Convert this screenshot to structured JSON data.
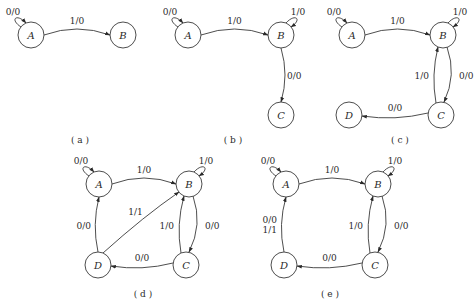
{
  "diagrams": [
    {
      "caption": "( a )",
      "states": [
        "A",
        "B"
      ],
      "transitions": [
        {
          "from": "A",
          "to": "A",
          "label": "0/0"
        },
        {
          "from": "A",
          "to": "B",
          "label": "1/0"
        }
      ]
    },
    {
      "caption": "( b )",
      "states": [
        "A",
        "B",
        "C"
      ],
      "transitions": [
        {
          "from": "A",
          "to": "A",
          "label": "0/0"
        },
        {
          "from": "A",
          "to": "B",
          "label": "1/0"
        },
        {
          "from": "B",
          "to": "B",
          "label": "1/0"
        },
        {
          "from": "B",
          "to": "C",
          "label": "0/0"
        }
      ]
    },
    {
      "caption": "( c )",
      "states": [
        "A",
        "B",
        "C",
        "D"
      ],
      "transitions": [
        {
          "from": "A",
          "to": "A",
          "label": "0/0"
        },
        {
          "from": "A",
          "to": "B",
          "label": "1/0"
        },
        {
          "from": "B",
          "to": "B",
          "label": "1/0"
        },
        {
          "from": "B",
          "to": "C",
          "label": "0/0"
        },
        {
          "from": "C",
          "to": "B",
          "label": "1/0"
        },
        {
          "from": "C",
          "to": "D",
          "label": "0/0"
        }
      ]
    },
    {
      "caption": "( d )",
      "states": [
        "A",
        "B",
        "C",
        "D"
      ],
      "transitions": [
        {
          "from": "A",
          "to": "A",
          "label": "0/0"
        },
        {
          "from": "A",
          "to": "B",
          "label": "1/0"
        },
        {
          "from": "B",
          "to": "B",
          "label": "1/0"
        },
        {
          "from": "B",
          "to": "C",
          "label": "0/0"
        },
        {
          "from": "C",
          "to": "B",
          "label": "1/0"
        },
        {
          "from": "C",
          "to": "D",
          "label": "0/0"
        },
        {
          "from": "D",
          "to": "A",
          "label": "0/0"
        },
        {
          "from": "D",
          "to": "B",
          "label": "1/1"
        }
      ]
    },
    {
      "caption": "( e )",
      "states": [
        "A",
        "B",
        "C",
        "D"
      ],
      "transitions": [
        {
          "from": "A",
          "to": "A",
          "label": "0/0"
        },
        {
          "from": "A",
          "to": "B",
          "label": "1/0"
        },
        {
          "from": "B",
          "to": "B",
          "label": "1/0"
        },
        {
          "from": "B",
          "to": "C",
          "label": "0/0"
        },
        {
          "from": "C",
          "to": "B",
          "label": "1/0"
        },
        {
          "from": "C",
          "to": "D",
          "label": "0/0"
        },
        {
          "from": "D",
          "to": "A",
          "label": "0/0\n1/1"
        }
      ]
    }
  ]
}
